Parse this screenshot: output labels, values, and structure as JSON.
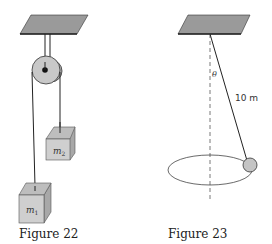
{
  "figures": [
    {
      "caption": "Figure 22",
      "masses": [
        {
          "label": "m",
          "sub": "1"
        },
        {
          "label": "m",
          "sub": "2"
        }
      ]
    },
    {
      "caption": "Figure 23",
      "angle_label": "θ",
      "length_label": "10 m"
    }
  ],
  "colors": {
    "ceiling": "#9a9a9a",
    "block_front": "#cfcfcf",
    "block_top": "#bdbdbd",
    "block_side": "#a8a8a8",
    "pulley": "#c8c8c8",
    "bob": "#c4c4c4",
    "line": "#222222"
  }
}
